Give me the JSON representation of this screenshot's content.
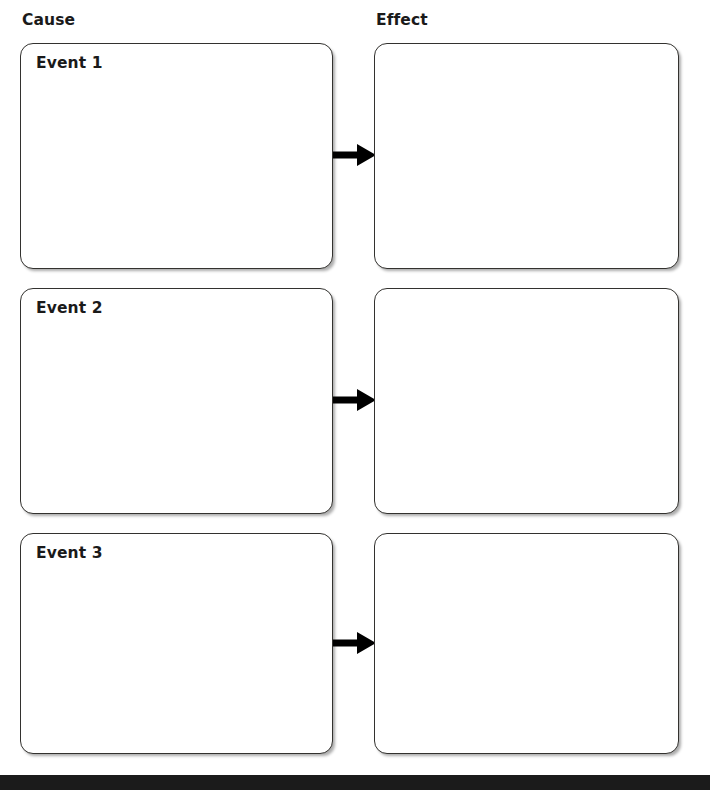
{
  "page": {
    "background_color": "#ffffff",
    "width": 710,
    "height": 790
  },
  "headers": {
    "cause": "Cause",
    "effect": "Effect"
  },
  "rows": [
    {
      "cause_label": "Event 1",
      "effect_label": "",
      "connector": "right-arrow"
    },
    {
      "cause_label": "Event 2",
      "effect_label": "",
      "connector": "right-arrow"
    },
    {
      "cause_label": "Event 3",
      "effect_label": "",
      "connector": "right-arrow"
    }
  ],
  "style": {
    "box_border_color": "#33322f",
    "text_color": "#1a1a1a",
    "arrow_color": "#000000",
    "bottom_bar_color": "#1b1b1b"
  }
}
